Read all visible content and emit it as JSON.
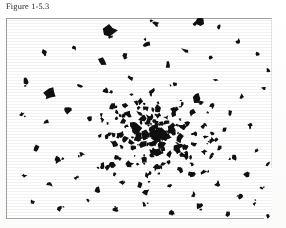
{
  "document": {
    "type": "scanned-book-figure",
    "caption": "Figure 1-5.3",
    "page_background": "#ffffff",
    "ink_color": "#101010",
    "rule_color": "#8d8d8d"
  },
  "figure": {
    "name": "fragment-dispersion-plot",
    "frame": {
      "x": 6,
      "y": 18,
      "width": 266,
      "height": 201
    }
  },
  "chart_data": {
    "type": "scatter",
    "title": "Figure 1-5.3",
    "xlabel": "",
    "ylabel": "",
    "xlim": [
      0,
      266
    ],
    "ylim": [
      0,
      201
    ],
    "grid": false,
    "legend": null,
    "center": [
      150,
      118
    ],
    "marker_color": "#101010",
    "points": [
      [
        104,
        12,
        5.2,
        14
      ],
      [
        150,
        6,
        3.4,
        -40
      ],
      [
        193,
        3,
        4.0,
        25
      ],
      [
        213,
        8,
        2.2,
        60
      ],
      [
        38,
        34,
        3.0,
        -55
      ],
      [
        68,
        30,
        2.0,
        35
      ],
      [
        96,
        44,
        4.6,
        -20
      ],
      [
        118,
        38,
        2.6,
        70
      ],
      [
        140,
        27,
        3.2,
        15
      ],
      [
        162,
        47,
        2.4,
        -35
      ],
      [
        180,
        33,
        3.6,
        50
      ],
      [
        205,
        40,
        2.0,
        -10
      ],
      [
        232,
        24,
        2.8,
        30
      ],
      [
        252,
        36,
        1.8,
        -60
      ],
      [
        262,
        52,
        2.2,
        20
      ],
      [
        20,
        63,
        2.4,
        40
      ],
      [
        44,
        76,
        5.0,
        -25
      ],
      [
        74,
        68,
        2.0,
        15
      ],
      [
        100,
        72,
        3.2,
        -45
      ],
      [
        124,
        60,
        2.6,
        55
      ],
      [
        146,
        74,
        3.0,
        -15
      ],
      [
        168,
        66,
        2.2,
        35
      ],
      [
        190,
        80,
        3.8,
        -50
      ],
      [
        210,
        62,
        2.0,
        20
      ],
      [
        236,
        78,
        2.6,
        -30
      ],
      [
        258,
        70,
        1.8,
        45
      ],
      [
        16,
        96,
        2.0,
        -20
      ],
      [
        40,
        104,
        2.4,
        30
      ],
      [
        62,
        92,
        2.8,
        -40
      ],
      [
        84,
        100,
        2.2,
        10
      ],
      [
        106,
        88,
        3.4,
        -55
      ],
      [
        122,
        96,
        3.0,
        25
      ],
      [
        134,
        84,
        2.6,
        -15
      ],
      [
        144,
        100,
        3.8,
        45
      ],
      [
        152,
        90,
        3.2,
        -30
      ],
      [
        160,
        104,
        2.8,
        20
      ],
      [
        168,
        94,
        3.6,
        -45
      ],
      [
        176,
        86,
        2.4,
        35
      ],
      [
        130,
        110,
        4.2,
        -20
      ],
      [
        140,
        116,
        3.4,
        50
      ],
      [
        150,
        108,
        3.0,
        -35
      ],
      [
        158,
        118,
        3.8,
        15
      ],
      [
        166,
        112,
        2.8,
        -50
      ],
      [
        174,
        120,
        3.2,
        30
      ],
      [
        182,
        106,
        2.6,
        -25
      ],
      [
        190,
        116,
        3.0,
        40
      ],
      [
        118,
        122,
        3.6,
        -15
      ],
      [
        126,
        130,
        2.8,
        55
      ],
      [
        136,
        126,
        3.4,
        -40
      ],
      [
        146,
        134,
        3.0,
        20
      ],
      [
        156,
        128,
        3.8,
        -30
      ],
      [
        164,
        136,
        2.6,
        45
      ],
      [
        172,
        130,
        3.2,
        -20
      ],
      [
        180,
        138,
        2.8,
        35
      ],
      [
        188,
        126,
        3.0,
        -50
      ],
      [
        198,
        134,
        2.4,
        25
      ],
      [
        206,
        122,
        2.8,
        -35
      ],
      [
        214,
        130,
        2.2,
        15
      ],
      [
        112,
        140,
        2.6,
        -45
      ],
      [
        124,
        146,
        3.0,
        30
      ],
      [
        138,
        142,
        2.4,
        -20
      ],
      [
        150,
        150,
        2.8,
        50
      ],
      [
        162,
        144,
        2.2,
        -30
      ],
      [
        174,
        152,
        2.6,
        20
      ],
      [
        186,
        146,
        2.0,
        -40
      ],
      [
        198,
        154,
        2.4,
        35
      ],
      [
        30,
        130,
        2.6,
        25
      ],
      [
        52,
        142,
        3.0,
        -35
      ],
      [
        76,
        136,
        2.4,
        15
      ],
      [
        96,
        148,
        2.8,
        -50
      ],
      [
        18,
        158,
        2.2,
        40
      ],
      [
        44,
        166,
        2.6,
        -20
      ],
      [
        70,
        160,
        2.0,
        30
      ],
      [
        92,
        172,
        2.4,
        -45
      ],
      [
        116,
        164,
        2.2,
        20
      ],
      [
        140,
        174,
        2.6,
        -30
      ],
      [
        164,
        168,
        2.0,
        50
      ],
      [
        188,
        176,
        2.4,
        -15
      ],
      [
        212,
        166,
        2.8,
        35
      ],
      [
        234,
        178,
        2.2,
        -40
      ],
      [
        256,
        170,
        1.8,
        25
      ],
      [
        26,
        184,
        2.0,
        -25
      ],
      [
        54,
        190,
        2.4,
        45
      ],
      [
        82,
        182,
        1.8,
        -35
      ],
      [
        110,
        192,
        2.2,
        20
      ],
      [
        138,
        186,
        2.0,
        -50
      ],
      [
        166,
        194,
        2.4,
        30
      ],
      [
        194,
        188,
        2.8,
        -20
      ],
      [
        222,
        196,
        2.2,
        40
      ],
      [
        248,
        186,
        2.0,
        -30
      ],
      [
        262,
        198,
        1.6,
        15
      ],
      [
        224,
        96,
        2.6,
        -45
      ],
      [
        244,
        108,
        2.2,
        25
      ],
      [
        228,
        140,
        2.4,
        -35
      ],
      [
        250,
        132,
        2.0,
        50
      ],
      [
        240,
        156,
        2.6,
        -20
      ],
      [
        262,
        146,
        1.8,
        30
      ],
      [
        206,
        88,
        2.0,
        -55
      ],
      [
        218,
        112,
        2.4,
        15
      ]
    ]
  },
  "annotations": {
    "visible_labels": [],
    "axes_visible": false
  }
}
